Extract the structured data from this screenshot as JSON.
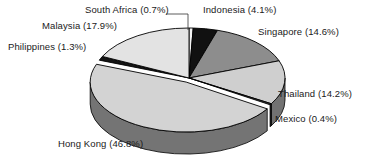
{
  "chart_data": {
    "type": "pie",
    "title": "",
    "subtitle": "",
    "xlabel": "",
    "ylabel": "",
    "legend_position": "none",
    "grid": false,
    "style": "3d-exploded-pie",
    "value_unit": "percent",
    "categories": [
      "South Africa",
      "Indonesia",
      "Singapore",
      "Thailand",
      "Mexico",
      "Hong Kong",
      "Philippines",
      "Malaysia"
    ],
    "values": [
      0.7,
      4.1,
      14.6,
      14.2,
      0.4,
      46.8,
      1.3,
      17.9
    ],
    "slices": [
      {
        "label": "South Africa (0.7%)",
        "name": "South Africa",
        "value": 0.7,
        "color": "#f2f2f2"
      },
      {
        "label": "Indonesia (4.1%)",
        "name": "Indonesia",
        "value": 4.1,
        "color": "#111111"
      },
      {
        "label": "Singapore (14.6%)",
        "name": "Singapore",
        "value": 14.6,
        "color": "#8d8d8d"
      },
      {
        "label": "Thailand (14.2%)",
        "name": "Thailand",
        "value": 14.2,
        "color": "#cfcfcf"
      },
      {
        "label": "Mexico (0.4%)",
        "name": "Mexico",
        "value": 0.4,
        "color": "#3a3a3a"
      },
      {
        "label": "Hong Kong (46.8%)",
        "name": "Hong Kong",
        "value": 46.8,
        "color": "#d3d3d3"
      },
      {
        "label": "Philippines (1.3%)",
        "name": "Philippines",
        "value": 1.3,
        "color": "#151515"
      },
      {
        "label": "Malaysia (17.9%)",
        "name": "Malaysia",
        "value": 17.9,
        "color": "#e3e3e3"
      }
    ],
    "colors": {
      "outline": "#000000",
      "background": "#ffffff",
      "text": "#1a1a1a",
      "side_shade": "#5c5c5c"
    }
  },
  "labels": {
    "south_africa": "South Africa (0.7%)",
    "indonesia": "Indonesia (4.1%)",
    "singapore": "Singapore (14.6%)",
    "thailand": "Thailand (14.2%)",
    "mexico": "Mexico (0.4%)",
    "hong_kong": "Hong Kong (46.8%)",
    "philippines": "Philippines (1.3%)",
    "malaysia": "Malaysia (17.9%)"
  }
}
